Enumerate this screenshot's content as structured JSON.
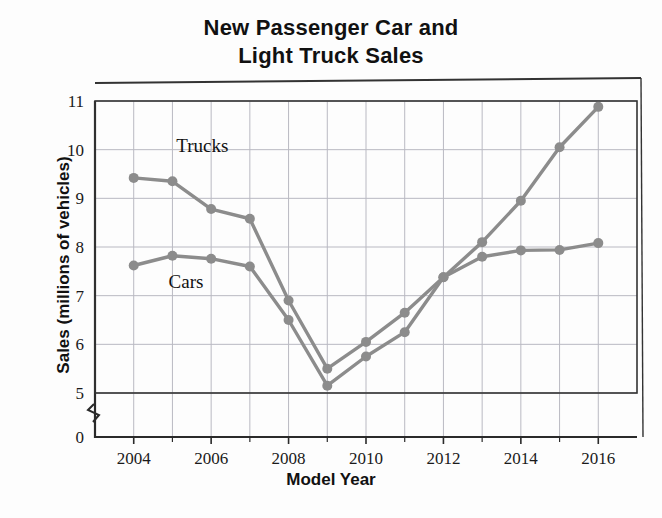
{
  "chart_data": {
    "type": "line",
    "title": "New Passenger Car and Light Truck Sales",
    "title_lines": [
      "New Passenger Car and",
      "Light Truck Sales"
    ],
    "xlabel": "Model Year",
    "ylabel": "Sales (millions of vehicles)",
    "x": [
      2004,
      2005,
      2006,
      2007,
      2008,
      2009,
      2010,
      2011,
      2012,
      2013,
      2014,
      2015,
      2016
    ],
    "xlim": [
      2003,
      2017
    ],
    "ylim": [
      4.7,
      11.2
    ],
    "xticks": [
      2004,
      2006,
      2008,
      2010,
      2012,
      2014,
      2016
    ],
    "xtick_labels": [
      "2004",
      "2006",
      "2008",
      "2010",
      "2012",
      "2014",
      "2016"
    ],
    "x_minor_ticks": [
      2005,
      2007,
      2009,
      2011,
      2013,
      2015
    ],
    "yticks": [
      5,
      6,
      7,
      8,
      9,
      10,
      11
    ],
    "ytick_labels": [
      "5",
      "6",
      "7",
      "8",
      "9",
      "10",
      "11"
    ],
    "y_origin_label": "0",
    "axis_break": true,
    "grid": true,
    "legend_position": "inline-annotations",
    "series": [
      {
        "name": "Trucks",
        "label": "Trucks",
        "color": "#8c8c8c",
        "label_x": 2005.1,
        "label_y": 9.95,
        "values": [
          9.42,
          9.35,
          8.78,
          8.58,
          6.9,
          5.5,
          6.05,
          6.65,
          7.38,
          8.1,
          8.95,
          10.05,
          10.88
        ]
      },
      {
        "name": "Cars",
        "label": "Cars",
        "color": "#8c8c8c",
        "label_x": 2004.9,
        "label_y": 7.16,
        "values": [
          7.62,
          7.82,
          7.76,
          7.6,
          6.5,
          5.15,
          5.75,
          6.25,
          7.38,
          7.8,
          7.93,
          7.94,
          8.08
        ]
      }
    ]
  },
  "colors": {
    "line": "#8c8c8c",
    "marker": "#8c8c8c",
    "grid": "#b9b9c2",
    "frame": "#333333",
    "axis": "#2a2a2a",
    "background": "#fdfdfd",
    "text": "#111111"
  }
}
